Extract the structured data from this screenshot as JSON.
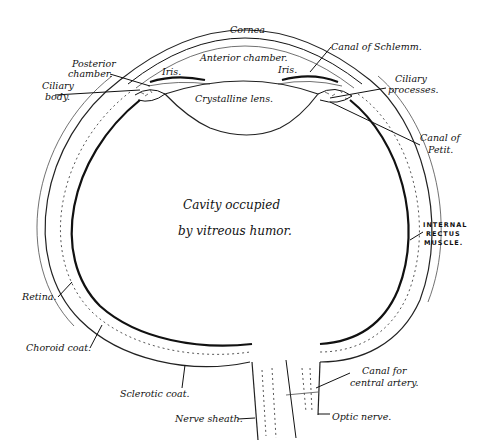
{
  "diagram": {
    "center_text": {
      "line1": "Cavity occupied",
      "line2": "by vitreous humor."
    },
    "labels": {
      "cornea": "Cornea",
      "anterior_chamber": "Anterior chamber.",
      "canal_of_schlemm": "Canal of Schlemm.",
      "posterior_chamber_1": "Posterior",
      "posterior_chamber_2": "chamber.",
      "ciliary_body_1": "Ciliary",
      "ciliary_body_2": "body.",
      "iris_left": "Iris.",
      "iris_right": "Iris.",
      "crystalline_lens": "Crystalline lens.",
      "ciliary_processes_1": "Ciliary",
      "ciliary_processes_2": "processes.",
      "canal_of_petit_1": "Canal of",
      "canal_of_petit_2": "Petit.",
      "internal_rectus_1": "INTERNAL",
      "internal_rectus_2": "RECTUS",
      "internal_rectus_3": "MUSCLE.",
      "retina": "Retina.",
      "choroid_coat": "Choroid coat.",
      "sclerotic_coat": "Sclerotic coat.",
      "nerve_sheath": "Nerve sheath.",
      "canal_central_artery_1": "Canal for",
      "canal_central_artery_2": "central artery.",
      "optic_nerve": "Optic nerve."
    },
    "colors": {
      "ink": "#111111",
      "background": "#ffffff"
    }
  }
}
